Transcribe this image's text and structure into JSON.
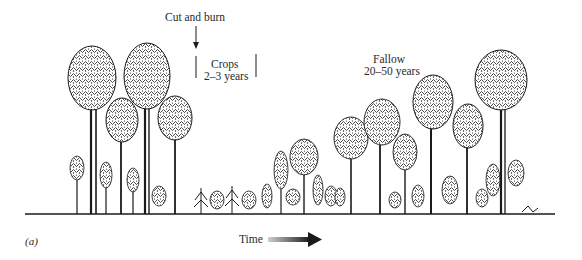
{
  "figure": {
    "panel_label": "(a)",
    "annotations": {
      "cut_and_burn": "Cut and burn",
      "crops_title": "Crops",
      "crops_duration": "2–3 years",
      "fallow_title": "Fallow",
      "fallow_duration": "20–50 years"
    },
    "time_axis": {
      "label": "Time",
      "arrow_direction": "right"
    },
    "colors": {
      "ink": "#1a1a1a",
      "arrow_start": "#c8c8c8",
      "arrow_end": "#1a1a1a",
      "background": "#ffffff"
    },
    "stages": [
      "mature forest",
      "cut and burn",
      "crops",
      "fallow regrowth",
      "mature forest"
    ]
  }
}
